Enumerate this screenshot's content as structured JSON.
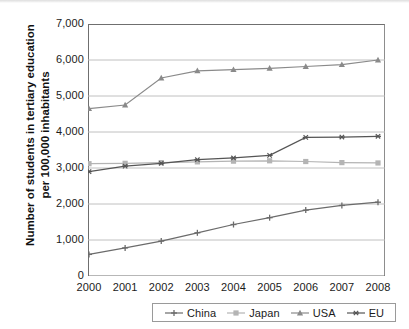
{
  "chart_data": {
    "type": "line",
    "title": "",
    "xlabel": "",
    "ylabel": "Number of students in tertiary education per 100,000 inhabitants",
    "categories": [
      "2000",
      "2001",
      "2002",
      "2003",
      "2004",
      "2005",
      "2006",
      "2007",
      "2008"
    ],
    "x": [
      2000,
      2001,
      2002,
      2003,
      2004,
      2005,
      2006,
      2007,
      2008
    ],
    "ylim": [
      0,
      7000
    ],
    "xlim": [
      2000,
      2008
    ],
    "yticks": [
      "0",
      "1,000",
      "2,000",
      "3,000",
      "4,000",
      "5,000",
      "6,000",
      "7,000"
    ],
    "ytick_values": [
      0,
      1000,
      2000,
      3000,
      4000,
      5000,
      6000,
      7000
    ],
    "grid": true,
    "legend_position": "bottom",
    "series": [
      {
        "name": "China",
        "marker": "cross",
        "color": "#6b6b6b",
        "values": [
          600,
          780,
          970,
          1200,
          1430,
          1620,
          1830,
          1960,
          2050
        ]
      },
      {
        "name": "Japan",
        "marker": "square",
        "color": "#b4b4b4",
        "values": [
          3120,
          3130,
          3150,
          3170,
          3190,
          3200,
          3180,
          3150,
          3140
        ]
      },
      {
        "name": "USA",
        "marker": "triangle",
        "color": "#8a8a8a",
        "values": [
          4650,
          4750,
          5500,
          5700,
          5730,
          5770,
          5820,
          5870,
          6000
        ]
      },
      {
        "name": "EU",
        "marker": "star",
        "color": "#555555",
        "values": [
          2900,
          3050,
          3130,
          3230,
          3280,
          3350,
          3850,
          3860,
          3880
        ]
      }
    ]
  },
  "legend": {
    "items": [
      {
        "label": "China"
      },
      {
        "label": "Japan"
      },
      {
        "label": "USA"
      },
      {
        "label": "EU"
      }
    ]
  }
}
